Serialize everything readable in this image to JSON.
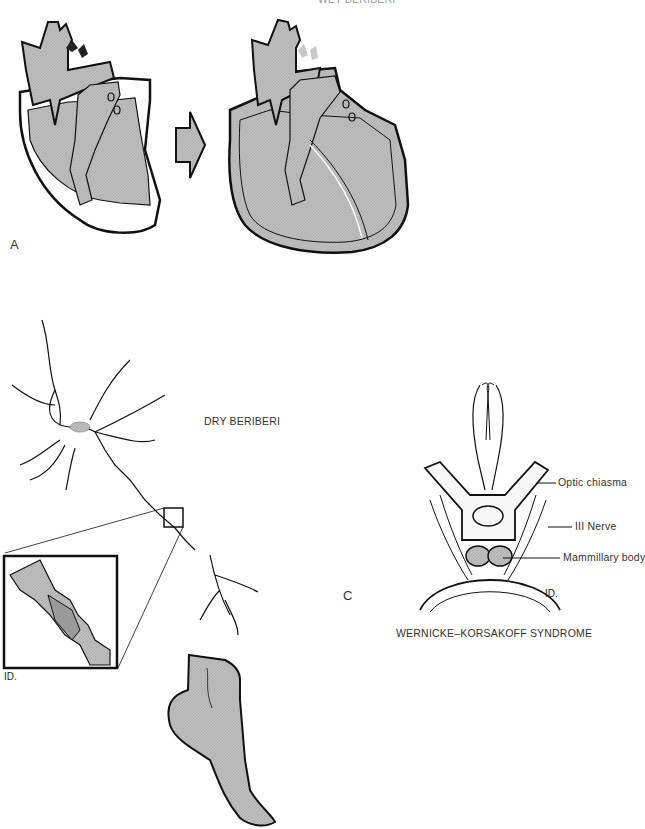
{
  "panel_a": {
    "letter": "A",
    "title": "WET BERIBERI",
    "normal_heart": "normal-heart",
    "enlarged_heart": "dilated-heart",
    "transition_arrow": "right-arrow"
  },
  "panel_b": {
    "title": "DRY BERIBERI",
    "neuron": "neuron",
    "inset": "axon-degeneration-inset",
    "foot": "foot-with-shaded-area",
    "signature": "ID."
  },
  "panel_c": {
    "letter": "C",
    "title": "WERNICKE–KORSAKOFF SYNDROME",
    "labels": [
      "Optic chiasma",
      "III Nerve",
      "Mammillary body"
    ],
    "signature": "ID."
  },
  "colors": {
    "fill_gray": "#b8b8b8",
    "outline": "#111111",
    "light_arrow": "#c8c8c8"
  }
}
